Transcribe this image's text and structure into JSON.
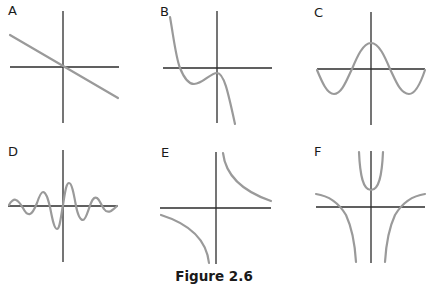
{
  "figure": {
    "caption": "Figure 2.6",
    "panels": [
      {
        "label": "A",
        "description": "linear function with negative slope through origin"
      },
      {
        "label": "B",
        "description": "cubic with negative leading coefficient, local min left of y-axis, local max near origin"
      },
      {
        "label": "C",
        "description": "cosine-like wave with maximum at y-axis"
      },
      {
        "label": "D",
        "description": "sinc-like damped oscillation"
      },
      {
        "label": "E",
        "description": "reciprocal hyperbola y = 1/x"
      },
      {
        "label": "F",
        "description": "rational function with two vertical asymptotes, U-shaped center branch"
      }
    ]
  },
  "colors": {
    "axis": "#2b2b2b",
    "curve": "#9a9a9a",
    "background": "#ffffff"
  }
}
